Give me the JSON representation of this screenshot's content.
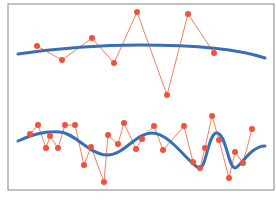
{
  "chart_data": {
    "type": "line",
    "title": "",
    "xlabel": "",
    "ylabel": "",
    "grid": false,
    "legend": null,
    "frame": {
      "x0": 8,
      "y0": 4,
      "x1": 274,
      "y1": 190,
      "stroke": "#9a9a9a"
    },
    "colors": {
      "points": "#f0533a",
      "point_line": "#f0805f",
      "fit": "#3a6fb5"
    },
    "series": [
      {
        "name": "top-samples",
        "kind": "points-connected",
        "points": [
          [
            37,
            46
          ],
          [
            62,
            60
          ],
          [
            92,
            38
          ],
          [
            114,
            63
          ],
          [
            137,
            12
          ],
          [
            167,
            95
          ],
          [
            188,
            14
          ],
          [
            214,
            53
          ]
        ]
      },
      {
        "name": "top-fit",
        "kind": "smooth-curve",
        "path": "M18,54 C60,48 100,45 140,45 C190,45 235,48 265,58"
      },
      {
        "name": "bottom-samples",
        "kind": "points-connected",
        "points": [
          [
            30,
            134
          ],
          [
            38,
            125
          ],
          [
            46,
            148
          ],
          [
            50,
            136
          ],
          [
            58,
            148
          ],
          [
            65,
            125
          ],
          [
            75,
            125
          ],
          [
            84,
            165
          ],
          [
            91,
            147
          ],
          [
            104,
            182
          ],
          [
            108,
            135
          ],
          [
            118,
            144
          ],
          [
            124,
            123
          ],
          [
            136,
            149
          ],
          [
            142,
            139
          ],
          [
            154,
            126
          ],
          [
            163,
            150
          ],
          [
            184,
            126
          ],
          [
            193,
            162
          ],
          [
            200,
            168
          ],
          [
            205,
            148
          ],
          [
            212,
            116
          ],
          [
            219,
            140
          ],
          [
            229,
            178
          ],
          [
            235,
            152
          ],
          [
            243,
            163
          ],
          [
            252,
            129
          ]
        ]
      },
      {
        "name": "bottom-fit",
        "kind": "smooth-curve",
        "path": "M18,141 C35,133 50,131 60,132 C75,133 90,155 107,155 C125,155 135,133 152,133 C170,133 190,165 199,168 C206,170 208,135 216,133 C226,131 228,168 235,168 C240,168 250,146 265,146"
      }
    ]
  }
}
